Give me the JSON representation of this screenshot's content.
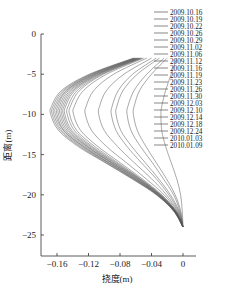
{
  "chart_data": {
    "type": "line",
    "title": "",
    "xlabel": "挠度(m)",
    "ylabel": "距离(m)",
    "xlim": [
      -0.18,
      0.005
    ],
    "ylim": [
      -27.5,
      0
    ],
    "x_ticks": [
      -0.16,
      -0.12,
      -0.08,
      -0.04,
      0
    ],
    "x_tick_labels": [
      "-0.16",
      "-0.12",
      "-0.08",
      "-0.04",
      "0"
    ],
    "y_ticks": [
      0,
      -5,
      -10,
      -15,
      -20,
      -25
    ],
    "y_tick_labels": [
      "0",
      "-5",
      "-10",
      "-15",
      "-20",
      "-25"
    ],
    "grid": false,
    "legend_position": "upper right, outside plot",
    "depth_points": [
      -3,
      -5,
      -7,
      -9,
      -10,
      -12,
      -14,
      -16,
      -18,
      -20,
      -22,
      -24
    ],
    "series": [
      {
        "name": "2009.10.16",
        "values": [
          -0.008,
          -0.015,
          -0.022,
          -0.027,
          -0.028,
          -0.027,
          -0.022,
          -0.015,
          -0.008,
          -0.003,
          -0.001,
          0
        ]
      },
      {
        "name": "2009.10.19",
        "values": [
          -0.02,
          -0.04,
          -0.055,
          -0.062,
          -0.063,
          -0.058,
          -0.047,
          -0.034,
          -0.021,
          -0.01,
          -0.003,
          0
        ]
      },
      {
        "name": "2009.10.22",
        "values": [
          -0.024,
          -0.046,
          -0.062,
          -0.07,
          -0.071,
          -0.066,
          -0.054,
          -0.039,
          -0.025,
          -0.012,
          -0.004,
          0
        ]
      },
      {
        "name": "2009.10.26",
        "values": [
          -0.03,
          -0.058,
          -0.076,
          -0.084,
          -0.085,
          -0.079,
          -0.065,
          -0.048,
          -0.031,
          -0.016,
          -0.005,
          0
        ]
      },
      {
        "name": "2009.10.29",
        "values": [
          -0.034,
          -0.064,
          -0.082,
          -0.09,
          -0.091,
          -0.085,
          -0.071,
          -0.053,
          -0.034,
          -0.018,
          -0.006,
          0
        ]
      },
      {
        "name": "2009.11.02",
        "values": [
          -0.04,
          -0.075,
          -0.097,
          -0.106,
          -0.107,
          -0.1,
          -0.083,
          -0.062,
          -0.04,
          -0.021,
          -0.007,
          0
        ]
      },
      {
        "name": "2009.11.06",
        "values": [
          -0.046,
          -0.088,
          -0.113,
          -0.123,
          -0.124,
          -0.116,
          -0.097,
          -0.072,
          -0.047,
          -0.024,
          -0.008,
          0
        ]
      },
      {
        "name": "2009.11.12",
        "values": [
          -0.05,
          -0.097,
          -0.126,
          -0.138,
          -0.139,
          -0.13,
          -0.108,
          -0.08,
          -0.052,
          -0.027,
          -0.009,
          0
        ]
      },
      {
        "name": "2009.11.16",
        "values": [
          -0.052,
          -0.101,
          -0.131,
          -0.143,
          -0.144,
          -0.135,
          -0.112,
          -0.083,
          -0.054,
          -0.028,
          -0.009,
          0
        ]
      },
      {
        "name": "2009.11.19",
        "values": [
          -0.053,
          -0.103,
          -0.134,
          -0.146,
          -0.147,
          -0.138,
          -0.115,
          -0.085,
          -0.055,
          -0.029,
          -0.01,
          0
        ]
      },
      {
        "name": "2009.11.23",
        "values": [
          -0.054,
          -0.105,
          -0.137,
          -0.149,
          -0.15,
          -0.141,
          -0.117,
          -0.087,
          -0.056,
          -0.029,
          -0.01,
          0
        ]
      },
      {
        "name": "2009.11.26",
        "values": [
          -0.055,
          -0.107,
          -0.139,
          -0.151,
          -0.152,
          -0.143,
          -0.119,
          -0.088,
          -0.057,
          -0.03,
          -0.01,
          0
        ]
      },
      {
        "name": "2009.11.30",
        "values": [
          -0.056,
          -0.108,
          -0.141,
          -0.153,
          -0.154,
          -0.145,
          -0.121,
          -0.09,
          -0.058,
          -0.03,
          -0.01,
          0
        ]
      },
      {
        "name": "2009.12.03",
        "values": [
          -0.057,
          -0.11,
          -0.143,
          -0.155,
          -0.156,
          -0.147,
          -0.122,
          -0.091,
          -0.059,
          -0.031,
          -0.011,
          0
        ]
      },
      {
        "name": "2009.12.10",
        "values": [
          -0.058,
          -0.111,
          -0.145,
          -0.157,
          -0.158,
          -0.149,
          -0.124,
          -0.092,
          -0.06,
          -0.031,
          -0.011,
          0
        ]
      },
      {
        "name": "2009.12.14",
        "values": [
          -0.059,
          -0.113,
          -0.147,
          -0.159,
          -0.16,
          -0.151,
          -0.126,
          -0.094,
          -0.061,
          -0.032,
          -0.011,
          0
        ]
      },
      {
        "name": "2009.12.18",
        "values": [
          -0.06,
          -0.114,
          -0.148,
          -0.161,
          -0.162,
          -0.152,
          -0.127,
          -0.095,
          -0.062,
          -0.032,
          -0.011,
          0
        ]
      },
      {
        "name": "2009.12.24",
        "values": [
          -0.061,
          -0.116,
          -0.15,
          -0.163,
          -0.164,
          -0.154,
          -0.129,
          -0.096,
          -0.063,
          -0.033,
          -0.012,
          0
        ]
      },
      {
        "name": "2010.01.03",
        "values": [
          -0.062,
          -0.117,
          -0.152,
          -0.165,
          -0.166,
          -0.156,
          -0.131,
          -0.098,
          -0.064,
          -0.033,
          -0.012,
          0
        ]
      },
      {
        "name": "2010.01.09",
        "values": [
          -0.063,
          -0.119,
          -0.154,
          -0.167,
          -0.168,
          -0.158,
          -0.133,
          -0.099,
          -0.065,
          -0.034,
          -0.012,
          0
        ]
      }
    ]
  },
  "style": {
    "line_color": "#555555",
    "axis_color": "#333333",
    "background": "#ffffff"
  }
}
